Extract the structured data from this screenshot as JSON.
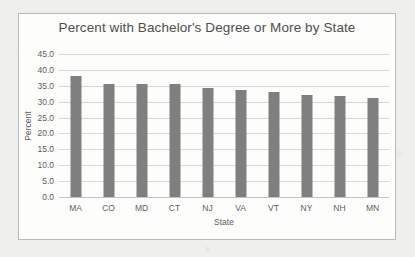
{
  "chart_data": {
    "type": "bar",
    "title": "Percent with Bachelor's Degree or More by State",
    "xlabel": "State",
    "ylabel": "Percent",
    "categories": [
      "MA",
      "CO",
      "MD",
      "CT",
      "NJ",
      "VA",
      "VT",
      "NY",
      "NH",
      "MN"
    ],
    "values": [
      38.0,
      35.6,
      35.5,
      35.5,
      34.3,
      33.8,
      33.0,
      32.2,
      31.7,
      31.2
    ],
    "ylim": [
      0.0,
      45.0
    ],
    "ytick_step": 5.0,
    "yticks": [
      "45.0",
      "40.0",
      "35.0",
      "30.0",
      "25.0",
      "20.0",
      "15.0",
      "10.0",
      "5.0",
      "0.0"
    ],
    "ytick_values": [
      45.0,
      40.0,
      35.0,
      30.0,
      25.0,
      20.0,
      15.0,
      10.0,
      5.0,
      0.0
    ],
    "grid": true,
    "legend": false,
    "bar_color": "#7f7f7f",
    "gridline_color": "#d6d6d4",
    "plot_background": "#fdfdfc",
    "text_color": "#5d5d5d",
    "border_color": "#b9b9b7"
  }
}
